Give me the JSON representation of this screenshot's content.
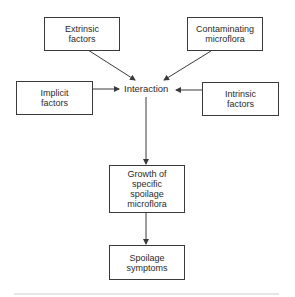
{
  "diagram": {
    "nodes": {
      "extrinsic": "Extrinsic factors",
      "contaminating": "Contaminating microflora",
      "implicit": "Implicit factors",
      "intrinsic": "Intrinsic factors",
      "interaction": "Interaction",
      "growth": "Growth of specific spoilage microflora",
      "spoilage": "Spoilage symptoms"
    },
    "lines": {
      "extrinsic": [
        "Extrinsic",
        "factors"
      ],
      "contaminating": [
        "Contaminating",
        "microflora"
      ],
      "implicit": [
        "Implicit",
        "factors"
      ],
      "intrinsic": [
        "Intrinsic",
        "factors"
      ],
      "growth": [
        "Growth of",
        "specific",
        "spoilage",
        "microflora"
      ],
      "spoilage": [
        "Spoilage",
        "symptoms"
      ]
    },
    "edges": [
      {
        "from": "extrinsic",
        "to": "interaction"
      },
      {
        "from": "contaminating",
        "to": "interaction"
      },
      {
        "from": "implicit",
        "to": "interaction"
      },
      {
        "from": "intrinsic",
        "to": "interaction"
      },
      {
        "from": "interaction",
        "to": "growth"
      },
      {
        "from": "growth",
        "to": "spoilage"
      }
    ],
    "colors": {
      "line": "#3a3a3a",
      "background": "#ffffff"
    }
  }
}
